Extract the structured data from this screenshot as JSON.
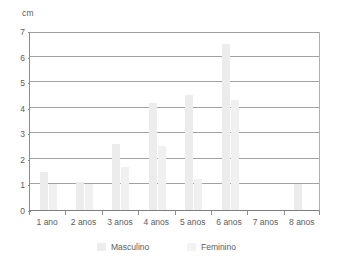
{
  "chart_data": {
    "type": "bar",
    "title": "",
    "subtitle": "",
    "xlabel": "",
    "ylabel": "cm",
    "ylim": [
      0,
      7
    ],
    "ytick_values": [
      0,
      1,
      2,
      3,
      4,
      5,
      6,
      7
    ],
    "ytick_labels": [
      "0",
      "1",
      "2",
      "3",
      "4",
      "5",
      "6",
      "7"
    ],
    "grid": true,
    "legend_position": "bottom",
    "categories": [
      "1 ano",
      "2 anos",
      "3 anos",
      "4 anos",
      "5 anos",
      "6 anos",
      "7 anos",
      "8 anos"
    ],
    "series": [
      {
        "name": "Masculino",
        "color": "#edecec",
        "values": [
          1.5,
          1.1,
          2.6,
          4.2,
          4.5,
          6.5,
          0,
          1.0
        ]
      },
      {
        "name": "Feminino",
        "color": "#f1f0f0",
        "values": [
          1.0,
          1.0,
          1.7,
          2.5,
          1.2,
          4.3,
          0,
          0
        ]
      }
    ]
  },
  "axis": {
    "unit_label": "cm"
  },
  "legend": {
    "items": [
      {
        "label": "Masculino",
        "swatch": "masculino-swatch"
      },
      {
        "label": "Feminino",
        "swatch": "feminino-swatch"
      }
    ]
  }
}
